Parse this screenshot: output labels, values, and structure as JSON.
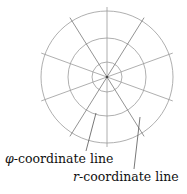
{
  "diagram": {
    "center": {
      "x": 107,
      "y": 77
    },
    "circles": [
      15,
      39,
      66
    ],
    "radial_angles_deg": [
      90,
      58,
      20,
      -20,
      -58
    ],
    "radial_extent": 70,
    "line_color": "#9a9a9a",
    "leader_color": "#555555",
    "labels": [
      {
        "symbol": "φ",
        "text": "-coordinate line",
        "x": 5,
        "y": 163
      },
      {
        "symbol": "r",
        "text": "-coordinate line",
        "x": 73,
        "y": 181
      }
    ],
    "leaders": [
      {
        "x1": 96,
        "y1": 113,
        "x2": 86,
        "y2": 151
      },
      {
        "x1": 140,
        "y1": 117,
        "x2": 134,
        "y2": 169
      }
    ]
  }
}
